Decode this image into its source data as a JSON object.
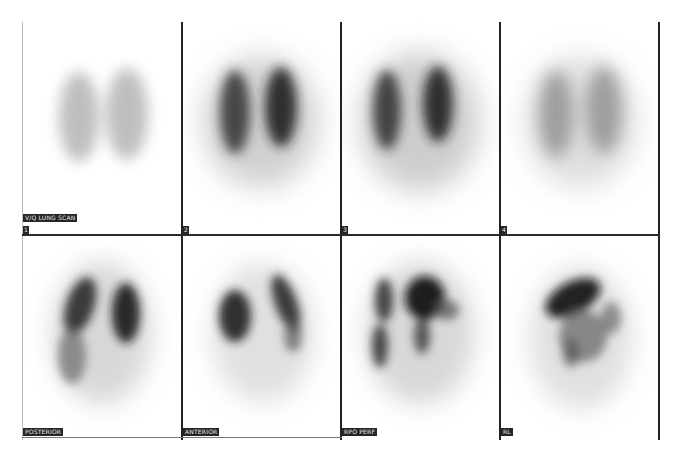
{
  "title_label": "V/Q LUNG SCAN",
  "top_row": {
    "panels": [
      {
        "index_label": "1",
        "intensity": "faint"
      },
      {
        "index_label": "2",
        "intensity": "moderate"
      },
      {
        "index_label": "3",
        "intensity": "moderate"
      },
      {
        "index_label": "4",
        "intensity": "faint"
      }
    ]
  },
  "bottom_row": {
    "panels": [
      {
        "view_label": "POSTERIOR"
      },
      {
        "view_label": "ANTERIOR"
      },
      {
        "view_label": "RPO PERF"
      },
      {
        "view_label": "RL"
      }
    ]
  },
  "colors": {
    "background": "#ffffff",
    "grid_lines": "#222222",
    "label_bg": "#262626",
    "label_text": "#e8e8e8",
    "uptake_dark": "#1e1e1e",
    "uptake_light": "#9a9a9a"
  }
}
